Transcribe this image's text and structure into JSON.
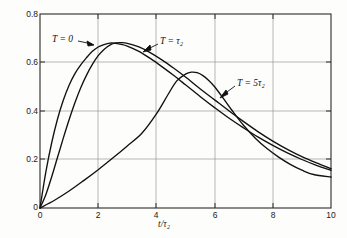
{
  "chart_data": {
    "type": "line",
    "title": "",
    "xlabel": "t/τ₂",
    "ylabel": "Input voltage",
    "xlim": [
      0,
      10
    ],
    "ylim": [
      0,
      0.8
    ],
    "xticks": [
      "0",
      "2",
      "4",
      "6",
      "8",
      "10"
    ],
    "xtick_values": [
      0,
      2,
      4,
      6,
      8,
      10
    ],
    "yticks": [
      "0",
      "0.2",
      "0.4",
      "0.6",
      "0.8"
    ],
    "ytick_values": [
      0,
      0.2,
      0.4,
      0.6,
      0.8
    ],
    "grid": true,
    "legend_position": "inline-annotations",
    "line_color": "#111111",
    "grid_color": "#9a9a9a",
    "frame_color": "#2a2a2a",
    "background": "#fdfdfb",
    "series": [
      {
        "name": "T = 0",
        "label": "T = 0",
        "annotation": "T = 0",
        "x": [
          0,
          0.2,
          0.4,
          0.6,
          0.8,
          1.0,
          1.2,
          1.4,
          1.6,
          1.8,
          2.0,
          2.2,
          2.4,
          2.6,
          2.8,
          3.0,
          3.4,
          3.8,
          4.2,
          4.6,
          5.0,
          5.5,
          6.0,
          6.5,
          7.0,
          7.5,
          8.0,
          8.5,
          9.0,
          9.5,
          10.0
        ],
        "y": [
          0,
          0.148,
          0.268,
          0.366,
          0.444,
          0.506,
          0.554,
          0.59,
          0.62,
          0.646,
          0.664,
          0.674,
          0.68,
          0.679,
          0.675,
          0.668,
          0.646,
          0.616,
          0.582,
          0.546,
          0.508,
          0.46,
          0.414,
          0.37,
          0.33,
          0.292,
          0.258,
          0.227,
          0.2,
          0.176,
          0.155
        ]
      },
      {
        "name": "T = tau2",
        "label": "T = τ₂",
        "annotation": "T = τ₂",
        "x": [
          0,
          0.2,
          0.4,
          0.6,
          0.8,
          1.0,
          1.2,
          1.4,
          1.6,
          1.8,
          2.0,
          2.2,
          2.4,
          2.6,
          2.8,
          3.0,
          3.4,
          3.8,
          4.2,
          4.6,
          5.0,
          5.5,
          6.0,
          6.5,
          7.0,
          7.5,
          8.0,
          8.5,
          9.0,
          9.5,
          10.0
        ],
        "y": [
          0,
          0.055,
          0.128,
          0.208,
          0.288,
          0.364,
          0.434,
          0.496,
          0.548,
          0.592,
          0.628,
          0.654,
          0.672,
          0.681,
          0.682,
          0.679,
          0.664,
          0.64,
          0.61,
          0.576,
          0.54,
          0.492,
          0.446,
          0.4,
          0.356,
          0.314,
          0.276,
          0.242,
          0.212,
          0.186,
          0.162
        ]
      },
      {
        "name": "T = 5 tau2",
        "label": "T = 5τ₂",
        "annotation": "T = 5τ₂",
        "x": [
          0,
          0.5,
          1.0,
          1.5,
          2.0,
          2.5,
          3.0,
          3.5,
          4.0,
          4.4,
          4.7,
          5.0,
          5.2,
          5.4,
          5.6,
          5.8,
          6.0,
          6.3,
          6.6,
          7.0,
          7.4,
          7.8,
          8.2,
          8.6,
          9.0,
          9.4,
          10.0
        ],
        "y": [
          0,
          0.032,
          0.07,
          0.113,
          0.158,
          0.206,
          0.256,
          0.308,
          0.388,
          0.468,
          0.524,
          0.552,
          0.56,
          0.558,
          0.546,
          0.526,
          0.5,
          0.452,
          0.402,
          0.34,
          0.288,
          0.245,
          0.21,
          0.18,
          0.156,
          0.138,
          0.128
        ]
      }
    ],
    "annotations": [
      {
        "text": "T = 0",
        "x_px": 52,
        "y_px": 38,
        "arrow": "right"
      },
      {
        "text": "T = τ₂",
        "x_px": 160,
        "y_px": 40,
        "arrow": "left-down"
      },
      {
        "text": "T = 5τ₂",
        "x_px": 237,
        "y_px": 82,
        "arrow": "left-down"
      }
    ]
  }
}
